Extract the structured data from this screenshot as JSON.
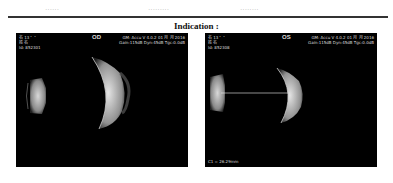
{
  "header_row": {
    "cells": [
      "······",
      "·········",
      "········"
    ]
  },
  "section": {
    "title": "Indication :"
  },
  "scans": [
    {
      "eye": "OD",
      "patient_line1": "名 13・・",
      "patient_line2": "姓 名",
      "patient_id": "Id: 852301",
      "device_line": "GM: Accu V 4.0.2  01 月 月 2016",
      "settings_line": "Gain:115dB Dyn:45dB Tgc:0.0dB",
      "measurement": ""
    },
    {
      "eye": "OS",
      "patient_line1": "名 13・・",
      "patient_line2": "姓 名",
      "patient_id": "Id: 852308",
      "device_line": "GM: Accu V 4.0.2  01 月 月 2016",
      "settings_line": "Gain:115dB Dyn:45dB Tgc:0.0dB",
      "measurement": "C1 = 26.29mm"
    }
  ],
  "colors": {
    "scan_background": "#000000",
    "echo": "#e6e6e6",
    "rule": "#333333"
  }
}
